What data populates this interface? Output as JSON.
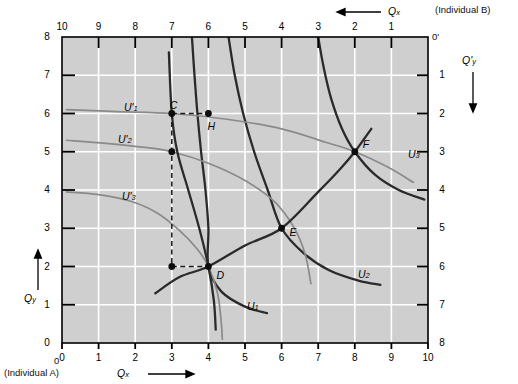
{
  "figure": {
    "type": "edgeworth-box",
    "corners": {
      "origin_a": "0",
      "origin_b": "0'",
      "individual_a": "(Individual A)",
      "individual_b": "(Individual B)"
    },
    "axes": {
      "bottom_title": "Qx",
      "bottom_title_base": "Q",
      "bottom_title_sub": "x",
      "bottom_arrow": "⟶",
      "left_title_base": "Q",
      "left_title_sub": "y",
      "left_arrow": "↑",
      "top_title_base": "Q",
      "top_title_sub": "x",
      "top_arrow": "⟵",
      "right_title_base": "Q'",
      "right_title_sub": "y",
      "right_arrow": "↓",
      "bottom_ticks": [
        "0",
        "1",
        "2",
        "3",
        "4",
        "5",
        "6",
        "7",
        "8",
        "9",
        "10"
      ],
      "left_ticks": [
        "0",
        "1",
        "2",
        "3",
        "4",
        "5",
        "6",
        "7",
        "8"
      ],
      "top_ticks": [
        "10",
        "9",
        "8",
        "7",
        "6",
        "5",
        "4",
        "3",
        "2",
        "1"
      ],
      "right_ticks": [
        "1",
        "2",
        "3",
        "4",
        "5",
        "6",
        "7",
        "8"
      ],
      "xlim": [
        0,
        10
      ],
      "ylim": [
        0,
        8
      ],
      "grid": true
    }
  },
  "chart_data": {
    "type": "line",
    "title": "",
    "xlabel": "Qx",
    "ylabel": "Qy",
    "xlim": [
      0,
      10
    ],
    "ylim": [
      0,
      8
    ],
    "grid": true,
    "points": [
      {
        "label": "C",
        "x": 3,
        "y": 6,
        "filled": true
      },
      {
        "label": "H",
        "x": 4,
        "y": 6,
        "filled": true
      },
      {
        "label": "D",
        "x": 4,
        "y": 2,
        "filled": true
      },
      {
        "label": "E",
        "x": 6,
        "y": 3,
        "filled": true
      },
      {
        "label": "F",
        "x": 8,
        "y": 5,
        "filled": true
      },
      {
        "label": "",
        "x": 3,
        "y": 5,
        "filled": true
      },
      {
        "label": "",
        "x": 3,
        "y": 2,
        "filled": true
      }
    ],
    "curve_labels": [
      {
        "name": "U'1",
        "base": "U'",
        "sub": "1",
        "owner": "B"
      },
      {
        "name": "U'2",
        "base": "U'",
        "sub": "2",
        "owner": "B"
      },
      {
        "name": "U'3",
        "base": "U'",
        "sub": "3",
        "owner": "B"
      },
      {
        "name": "U1",
        "base": "U",
        "sub": "1",
        "owner": "A"
      },
      {
        "name": "U2",
        "base": "U",
        "sub": "2",
        "owner": "A"
      },
      {
        "name": "U3",
        "base": "U",
        "sub": "3",
        "owner": "A"
      }
    ],
    "series": [
      {
        "name": "U1",
        "owner": "A",
        "color": "#2a2a2a",
        "points": [
          [
            3.55,
            8.0
          ],
          [
            3.62,
            7.0
          ],
          [
            3.7,
            6.0
          ],
          [
            3.8,
            5.0
          ],
          [
            3.92,
            4.0
          ],
          [
            4.0,
            3.0
          ],
          [
            4.0,
            2.0
          ],
          [
            4.35,
            1.35
          ],
          [
            5.0,
            0.95
          ],
          [
            5.6,
            0.78
          ]
        ]
      },
      {
        "name": "U2",
        "owner": "A",
        "color": "#2a2a2a",
        "points": [
          [
            4.55,
            8.0
          ],
          [
            4.72,
            7.0
          ],
          [
            4.95,
            6.0
          ],
          [
            5.25,
            5.0
          ],
          [
            5.62,
            4.0
          ],
          [
            6.0,
            3.0
          ],
          [
            6.6,
            2.35
          ],
          [
            7.3,
            1.9
          ],
          [
            8.1,
            1.63
          ],
          [
            8.7,
            1.52
          ]
        ]
      },
      {
        "name": "U3",
        "owner": "A",
        "color": "#2a2a2a",
        "points": [
          [
            7.0,
            8.0
          ],
          [
            7.15,
            7.2
          ],
          [
            7.35,
            6.4
          ],
          [
            7.65,
            5.6
          ],
          [
            8.0,
            5.0
          ],
          [
            8.55,
            4.4
          ],
          [
            9.2,
            4.0
          ],
          [
            9.9,
            3.75
          ]
        ]
      },
      {
        "name": "U'1",
        "owner": "B",
        "color": "#8a8a8a",
        "points": [
          [
            0.12,
            6.1
          ],
          [
            1.5,
            6.05
          ],
          [
            3.0,
            6.0
          ],
          [
            4.5,
            5.85
          ],
          [
            6.0,
            5.6
          ],
          [
            7.2,
            5.25
          ],
          [
            8.0,
            5.0
          ],
          [
            8.9,
            4.6
          ],
          [
            9.6,
            4.2
          ]
        ]
      },
      {
        "name": "U'2",
        "owner": "B",
        "color": "#8a8a8a",
        "points": [
          [
            0.12,
            5.3
          ],
          [
            1.2,
            5.22
          ],
          [
            2.2,
            5.12
          ],
          [
            3.0,
            5.0
          ],
          [
            4.0,
            4.7
          ],
          [
            5.0,
            4.25
          ],
          [
            5.8,
            3.7
          ],
          [
            6.35,
            3.0
          ],
          [
            6.65,
            2.3
          ],
          [
            6.8,
            1.55
          ]
        ]
      },
      {
        "name": "U'3",
        "owner": "B",
        "color": "#8a8a8a",
        "points": [
          [
            0.12,
            3.95
          ],
          [
            1.0,
            3.88
          ],
          [
            1.9,
            3.7
          ],
          [
            2.6,
            3.4
          ],
          [
            3.2,
            2.95
          ],
          [
            3.7,
            2.45
          ],
          [
            4.0,
            2.0
          ],
          [
            4.25,
            1.3
          ],
          [
            4.35,
            0.55
          ],
          [
            4.38,
            0.1
          ]
        ]
      },
      {
        "name": "contract-curve",
        "owner": "both",
        "color": "#2a2a2a",
        "points": [
          [
            2.55,
            1.3
          ],
          [
            3.2,
            1.72
          ],
          [
            4.0,
            2.0
          ],
          [
            5.0,
            2.55
          ],
          [
            6.0,
            3.0
          ],
          [
            7.0,
            3.95
          ],
          [
            7.6,
            4.55
          ],
          [
            8.0,
            5.0
          ],
          [
            8.45,
            5.6
          ]
        ]
      },
      {
        "name": "trading-path",
        "owner": "both",
        "color": "#2a2a2a",
        "points": [
          [
            2.92,
            7.6
          ],
          [
            3.0,
            6.0
          ],
          [
            3.15,
            5.0
          ],
          [
            3.45,
            4.0
          ],
          [
            3.75,
            3.0
          ],
          [
            4.0,
            2.0
          ],
          [
            4.15,
            1.1
          ],
          [
            4.2,
            0.35
          ]
        ]
      }
    ],
    "dashed_guides": [
      {
        "from": [
          3,
          6
        ],
        "to": [
          4,
          6
        ]
      },
      {
        "from": [
          3,
          6
        ],
        "to": [
          3,
          2
        ]
      },
      {
        "from": [
          3,
          2
        ],
        "to": [
          4,
          2
        ]
      }
    ]
  }
}
